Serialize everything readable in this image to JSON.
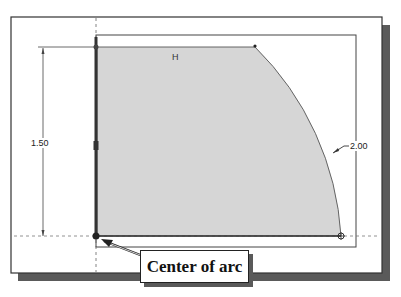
{
  "sketch": {
    "relation_label": "H",
    "dimensions": {
      "vertical": "1.50",
      "radius": "2.00"
    },
    "callout": {
      "label": "Center of arc"
    }
  },
  "colors": {
    "frame_border": "#333333",
    "shadow": "#5a5a5a",
    "fill": "#d6d6d6",
    "line": "#444444"
  }
}
